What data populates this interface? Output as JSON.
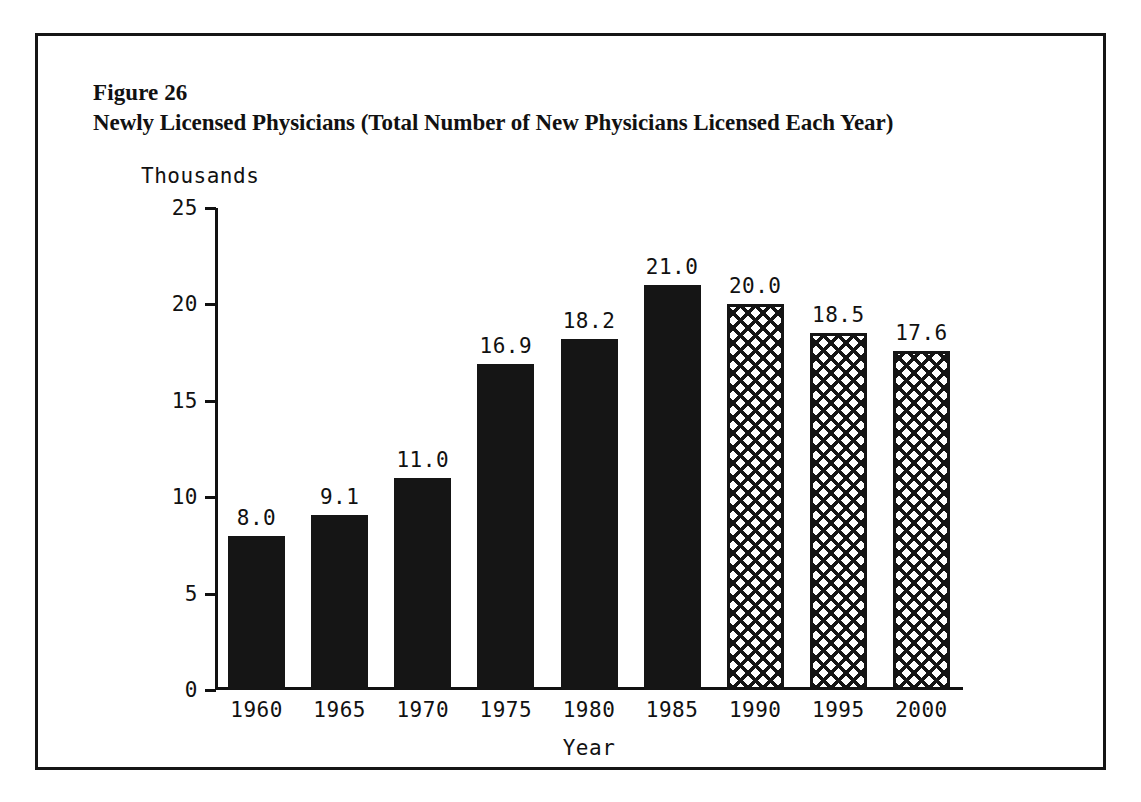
{
  "figure": {
    "number_label": "Figure 26",
    "title": "Newly Licensed Physicians (Total Number of New Physicians Licensed Each Year)"
  },
  "chart_data": {
    "type": "bar",
    "title": "Newly Licensed Physicians (Total Number of New Physicians Licensed Each Year)",
    "xlabel": "Year",
    "ylabel": "Thousands",
    "categories": [
      "1960",
      "1965",
      "1970",
      "1975",
      "1980",
      "1985",
      "1990",
      "1995",
      "2000"
    ],
    "values": [
      8.0,
      9.1,
      11.0,
      16.9,
      18.2,
      21.0,
      20.0,
      18.5,
      17.6
    ],
    "value_labels": [
      "8.0",
      "9.1",
      "11.0",
      "16.9",
      "18.2",
      "21.0",
      "20.0",
      "18.5",
      "17.6"
    ],
    "bar_styles": [
      "solid",
      "solid",
      "solid",
      "solid",
      "solid",
      "solid",
      "hatch",
      "hatch",
      "hatch"
    ],
    "ylim": [
      0,
      25
    ],
    "yticks": [
      0,
      5,
      10,
      15,
      20,
      25
    ],
    "ytick_labels": [
      "0",
      "5",
      "10",
      "15",
      "20",
      "25"
    ],
    "grid": false,
    "legend": null,
    "colors": {
      "solid_bar": "#151515",
      "hatch_line": "#151515",
      "hatch_background": "#ffffff",
      "axis": "#111111",
      "text": "#111111",
      "page_background": "#ffffff"
    }
  }
}
